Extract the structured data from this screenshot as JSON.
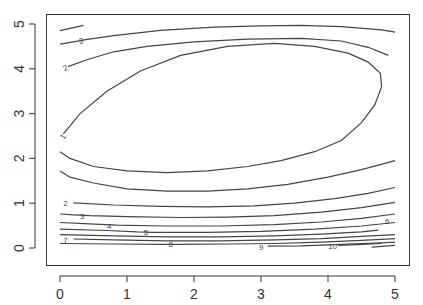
{
  "chart_data": {
    "type": "contour",
    "title": "",
    "xlabel": "",
    "ylabel": "",
    "xlim": [
      0,
      5
    ],
    "ylim": [
      0,
      5
    ],
    "grid": false,
    "legend": null,
    "x_ticks": [
      0,
      1,
      2,
      3,
      4,
      5
    ],
    "y_ticks": [
      0,
      1,
      2,
      3,
      4,
      5
    ],
    "x_tick_labels": [
      "0",
      "1",
      "2",
      "3",
      "4",
      "5"
    ],
    "y_tick_labels": [
      "0",
      "1",
      "2",
      "3",
      "4",
      "5"
    ],
    "levels": [
      1,
      2,
      3,
      4,
      5,
      6,
      7,
      8,
      9,
      10
    ],
    "contours": [
      {
        "level": 1,
        "label": "1",
        "label_at": [
          0.02,
          2.45
        ],
        "label_rot": -55,
        "points": [
          [
            0.05,
            2.55
          ],
          [
            0.3,
            3.0
          ],
          [
            0.7,
            3.5
          ],
          [
            1.2,
            3.95
          ],
          [
            1.8,
            4.3
          ],
          [
            2.5,
            4.5
          ],
          [
            3.2,
            4.57
          ],
          [
            3.8,
            4.5
          ],
          [
            4.3,
            4.35
          ],
          [
            4.6,
            4.15
          ],
          [
            4.78,
            3.9
          ],
          [
            4.8,
            3.6
          ],
          [
            4.7,
            3.2
          ],
          [
            4.5,
            2.8
          ],
          [
            4.2,
            2.4
          ],
          [
            3.8,
            2.15
          ],
          [
            3.3,
            1.95
          ],
          [
            2.8,
            1.82
          ],
          [
            2.2,
            1.72
          ],
          [
            1.6,
            1.68
          ],
          [
            1.0,
            1.72
          ],
          [
            0.5,
            1.82
          ],
          [
            0.15,
            2.0
          ],
          [
            0.0,
            2.15
          ]
        ]
      },
      {
        "level": 1,
        "label": "",
        "label_at": null,
        "points": [
          [
            0.0,
            1.72
          ],
          [
            0.15,
            1.58
          ],
          [
            0.5,
            1.45
          ],
          [
            1.0,
            1.32
          ],
          [
            1.6,
            1.27
          ],
          [
            2.2,
            1.27
          ],
          [
            2.8,
            1.32
          ],
          [
            3.4,
            1.42
          ],
          [
            4.0,
            1.58
          ],
          [
            4.5,
            1.75
          ],
          [
            5.0,
            1.95
          ]
        ]
      },
      {
        "level": 2,
        "label": "2",
        "label_at": [
          0.05,
          4.0
        ],
        "label_rot": -25,
        "points": [
          [
            0.12,
            4.05
          ],
          [
            0.4,
            4.2
          ],
          [
            0.8,
            4.38
          ],
          [
            1.3,
            4.5
          ],
          [
            2.0,
            4.6
          ],
          [
            2.8,
            4.66
          ],
          [
            3.6,
            4.68
          ],
          [
            4.2,
            4.62
          ],
          [
            4.6,
            4.48
          ],
          [
            4.9,
            4.3
          ]
        ]
      },
      {
        "level": 2,
        "label": "2",
        "label_at": [
          0.05,
          1.0
        ],
        "label_rot": 0,
        "points": [
          [
            0.2,
            1.01
          ],
          [
            0.8,
            0.96
          ],
          [
            1.5,
            0.93
          ],
          [
            2.2,
            0.92
          ],
          [
            2.9,
            0.94
          ],
          [
            3.5,
            1.0
          ],
          [
            4.1,
            1.1
          ],
          [
            4.6,
            1.22
          ],
          [
            5.0,
            1.35
          ]
        ]
      },
      {
        "level": 3,
        "label": "3",
        "label_at": [
          0.28,
          4.62
        ],
        "label_rot": -10,
        "points": [
          [
            0.0,
            4.55
          ],
          [
            0.2,
            4.6
          ],
          [
            0.38,
            4.65
          ],
          [
            0.8,
            4.74
          ],
          [
            1.5,
            4.86
          ],
          [
            2.3,
            4.93
          ],
          [
            3.0,
            4.96
          ],
          [
            3.6,
            4.97
          ],
          [
            4.2,
            4.94
          ],
          [
            4.8,
            4.87
          ],
          [
            5.0,
            4.82
          ]
        ]
      },
      {
        "level": 3,
        "label": "",
        "label_at": null,
        "points": [
          [
            0.0,
            4.85
          ],
          [
            0.35,
            4.97
          ]
        ]
      },
      {
        "level": 3,
        "label": "3",
        "label_at": [
          0.3,
          0.72
        ],
        "label_rot": 0,
        "points": [
          [
            0.0,
            0.76
          ],
          [
            0.2,
            0.74
          ],
          [
            0.45,
            0.72
          ],
          [
            1.0,
            0.7
          ],
          [
            1.8,
            0.68
          ],
          [
            2.5,
            0.69
          ],
          [
            3.2,
            0.72
          ],
          [
            3.9,
            0.8
          ],
          [
            4.5,
            0.9
          ],
          [
            5.0,
            1.02
          ]
        ]
      },
      {
        "level": 4,
        "label": "4",
        "label_at": [
          0.7,
          0.5
        ],
        "label_rot": 0,
        "points": [
          [
            0.0,
            0.57
          ],
          [
            0.6,
            0.53
          ],
          [
            0.85,
            0.51
          ],
          [
            1.6,
            0.49
          ],
          [
            2.4,
            0.49
          ],
          [
            3.2,
            0.52
          ],
          [
            3.9,
            0.58
          ],
          [
            4.5,
            0.66
          ],
          [
            5.0,
            0.76
          ]
        ]
      },
      {
        "level": 5,
        "label": "5",
        "label_at": [
          1.25,
          0.35
        ],
        "label_rot": 0,
        "points": [
          [
            0.0,
            0.42
          ],
          [
            0.7,
            0.39
          ],
          [
            1.15,
            0.36
          ],
          [
            1.4,
            0.35
          ],
          [
            2.2,
            0.35
          ],
          [
            3.0,
            0.37
          ],
          [
            3.8,
            0.42
          ],
          [
            4.5,
            0.49
          ],
          [
            5.0,
            0.57
          ]
        ]
      },
      {
        "level": 6,
        "label": "6",
        "label_at": [
          4.85,
          0.6
        ],
        "label_rot": 0,
        "points": [
          [
            0.0,
            0.3
          ],
          [
            0.8,
            0.27
          ],
          [
            1.6,
            0.25
          ],
          [
            2.4,
            0.25
          ],
          [
            3.2,
            0.27
          ],
          [
            3.9,
            0.31
          ],
          [
            4.5,
            0.36
          ],
          [
            4.75,
            0.4
          ]
        ]
      },
      {
        "level": 7,
        "label": "7",
        "label_at": [
          0.05,
          0.18
        ],
        "label_rot": 0,
        "points": [
          [
            0.2,
            0.2
          ],
          [
            0.8,
            0.18
          ],
          [
            1.6,
            0.16
          ],
          [
            2.4,
            0.16
          ],
          [
            3.2,
            0.18
          ],
          [
            3.9,
            0.21
          ],
          [
            4.5,
            0.26
          ],
          [
            5.0,
            0.3
          ]
        ]
      },
      {
        "level": 8,
        "label": "8",
        "label_at": [
          1.62,
          0.08
        ],
        "label_rot": 0,
        "points": [
          [
            0.0,
            0.1
          ],
          [
            0.8,
            0.09
          ],
          [
            1.55,
            0.08
          ],
          [
            1.75,
            0.08
          ],
          [
            2.5,
            0.09
          ],
          [
            3.2,
            0.1
          ],
          [
            3.9,
            0.13
          ],
          [
            4.5,
            0.17
          ],
          [
            5.0,
            0.21
          ]
        ]
      },
      {
        "level": 9,
        "label": "9",
        "label_at": [
          2.97,
          0.02
        ],
        "label_rot": 0,
        "points": [
          [
            3.1,
            0.04
          ],
          [
            3.6,
            0.05
          ],
          [
            4.2,
            0.08
          ],
          [
            4.7,
            0.11
          ],
          [
            5.0,
            0.13
          ]
        ]
      },
      {
        "level": 10,
        "label": "10",
        "label_at": [
          4.0,
          0.05
        ],
        "label_rot": 0,
        "points": [
          [
            4.15,
            0.06
          ],
          [
            4.5,
            0.08
          ],
          [
            4.8,
            0.1
          ]
        ]
      },
      {
        "level": 10,
        "label": "",
        "label_at": null,
        "points": [
          [
            4.65,
            0.02
          ],
          [
            5.0,
            0.06
          ]
        ]
      }
    ]
  }
}
